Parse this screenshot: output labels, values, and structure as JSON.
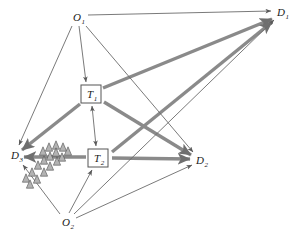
{
  "figure": {
    "background_color": "#ffffff",
    "thin_edge_color": "#6b6b6b",
    "thick_edge_color": "#8a8a8a",
    "tree_fill_color": "#b3b3b3",
    "tree_stroke_color": "#4d4d4d",
    "node_box_stroke": "#555555"
  },
  "nodes": [
    {
      "id": "O1",
      "base": "O",
      "sub": "1",
      "shape": "plain",
      "x": 77,
      "y": 17,
      "role": "origin"
    },
    {
      "id": "O2",
      "base": "O",
      "sub": "2",
      "shape": "plain",
      "x": 66,
      "y": 222,
      "role": "origin"
    },
    {
      "id": "T1",
      "base": "T",
      "sub": "1",
      "shape": "box",
      "x": 91,
      "y": 94,
      "role": "transshipment"
    },
    {
      "id": "T2",
      "base": "T",
      "sub": "2",
      "shape": "box",
      "x": 98,
      "y": 158,
      "role": "transshipment"
    },
    {
      "id": "D1",
      "base": "D",
      "sub": "1",
      "shape": "plain",
      "x": 281,
      "y": 12,
      "role": "destination"
    },
    {
      "id": "D2",
      "base": "D",
      "sub": "2",
      "shape": "plain",
      "x": 200,
      "y": 160,
      "role": "destination"
    },
    {
      "id": "D3",
      "base": "D",
      "sub": "3",
      "shape": "plain",
      "x": 15,
      "y": 155,
      "role": "destination"
    }
  ],
  "edges": [
    {
      "from": "O1",
      "to": "D1",
      "weight": "thin",
      "arrow": "single"
    },
    {
      "from": "O1",
      "to": "T1",
      "weight": "thin",
      "arrow": "single"
    },
    {
      "from": "O1",
      "to": "D3",
      "weight": "thin",
      "arrow": "single"
    },
    {
      "from": "O1",
      "to": "D2",
      "weight": "thin",
      "arrow": "single"
    },
    {
      "from": "O2",
      "to": "D3",
      "weight": "thin",
      "arrow": "single"
    },
    {
      "from": "O2",
      "to": "T2",
      "weight": "thin",
      "arrow": "single"
    },
    {
      "from": "O2",
      "to": "D1",
      "weight": "thin",
      "arrow": "single"
    },
    {
      "from": "O2",
      "to": "D2",
      "weight": "thin",
      "arrow": "single"
    },
    {
      "from": "T1",
      "to": "T2",
      "weight": "thin",
      "arrow": "double"
    },
    {
      "from": "T1",
      "to": "D1",
      "weight": "thick",
      "arrow": "single"
    },
    {
      "from": "T1",
      "to": "D2",
      "weight": "thick",
      "arrow": "single"
    },
    {
      "from": "T1",
      "to": "D3",
      "weight": "thick",
      "arrow": "single"
    },
    {
      "from": "T2",
      "to": "D1",
      "weight": "thick",
      "arrow": "single"
    },
    {
      "from": "T2",
      "to": "D2",
      "weight": "thick",
      "arrow": "single"
    },
    {
      "from": "T2",
      "to": "D3",
      "weight": "thick",
      "arrow": "single"
    }
  ],
  "tree_cluster": {
    "name": "tree-cluster",
    "description": "cluster of triangular tree symbols near destination D3",
    "count": 17,
    "triangles": [
      {
        "x": 56,
        "y": 145
      },
      {
        "x": 49,
        "y": 147
      },
      {
        "x": 63,
        "y": 147
      },
      {
        "x": 43,
        "y": 151
      },
      {
        "x": 56,
        "y": 152
      },
      {
        "x": 68,
        "y": 151
      },
      {
        "x": 50,
        "y": 156
      },
      {
        "x": 62,
        "y": 157
      },
      {
        "x": 44,
        "y": 160
      },
      {
        "x": 57,
        "y": 161
      },
      {
        "x": 38,
        "y": 165
      },
      {
        "x": 50,
        "y": 166
      },
      {
        "x": 32,
        "y": 172
      },
      {
        "x": 44,
        "y": 172
      },
      {
        "x": 26,
        "y": 178
      },
      {
        "x": 37,
        "y": 179
      },
      {
        "x": 30,
        "y": 184
      }
    ]
  }
}
